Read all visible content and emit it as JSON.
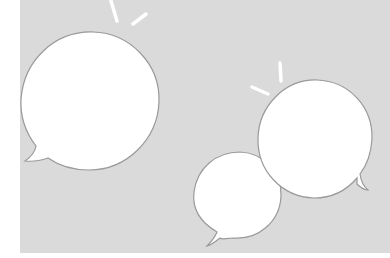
{
  "illustration": {
    "description": "Three blank white speech bubbles on a light gray background with small white sparkle strokes",
    "colors": {
      "background": "#dadada",
      "margin": "#ffffff",
      "bubble_fill": "#ffffff",
      "bubble_stroke": "#9a9a9a",
      "sparkle": "#ffffff"
    },
    "bubbles": [
      {
        "name": "large-left-bubble",
        "text": ""
      },
      {
        "name": "large-right-bubble",
        "text": ""
      },
      {
        "name": "small-bottom-bubble",
        "text": ""
      }
    ]
  }
}
